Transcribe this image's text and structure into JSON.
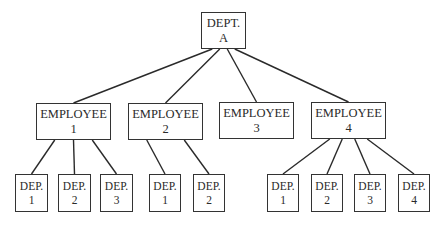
{
  "diagram": {
    "type": "org-tree",
    "root": {
      "id": "dept-a",
      "line1": "DEPT.",
      "line2": "A",
      "children": [
        {
          "id": "employee-1",
          "line1": "EMPLOYEE",
          "line2": "1",
          "children": [
            {
              "id": "e1-dep-1",
              "line1": "DEP.",
              "line2": "1"
            },
            {
              "id": "e1-dep-2",
              "line1": "DEP.",
              "line2": "2"
            },
            {
              "id": "e1-dep-3",
              "line1": "DEP.",
              "line2": "3"
            }
          ]
        },
        {
          "id": "employee-2",
          "line1": "EMPLOYEE",
          "line2": "2",
          "children": [
            {
              "id": "e2-dep-1",
              "line1": "DEP.",
              "line2": "1"
            },
            {
              "id": "e2-dep-2",
              "line1": "DEP.",
              "line2": "2"
            }
          ]
        },
        {
          "id": "employee-3",
          "line1": "EMPLOYEE",
          "line2": "3",
          "children": []
        },
        {
          "id": "employee-4",
          "line1": "EMPLOYEE",
          "line2": "4",
          "children": [
            {
              "id": "e4-dep-1",
              "line1": "DEP.",
              "line2": "1"
            },
            {
              "id": "e4-dep-2",
              "line1": "DEP.",
              "line2": "2"
            },
            {
              "id": "e4-dep-3",
              "line1": "DEP.",
              "line2": "3"
            },
            {
              "id": "e4-dep-4",
              "line1": "DEP.",
              "line2": "4"
            }
          ]
        }
      ]
    }
  }
}
